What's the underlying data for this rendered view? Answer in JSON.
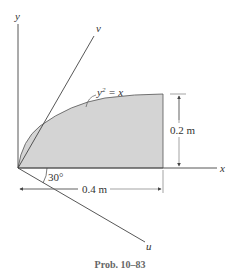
{
  "diagram": {
    "axes": {
      "x_label": "x",
      "y_label": "y",
      "u_label": "u",
      "v_label": "v"
    },
    "curve_label": "y² = x",
    "curve_label_base": "y",
    "curve_label_exp": "2",
    "curve_label_rest": " = x",
    "angle_label": "30°",
    "height_dimension": "0.2 m",
    "width_dimension": "0.4 m",
    "caption": "Prob. 10–83",
    "colors": {
      "shade": "#d4d4d4",
      "line": "#444444"
    }
  }
}
